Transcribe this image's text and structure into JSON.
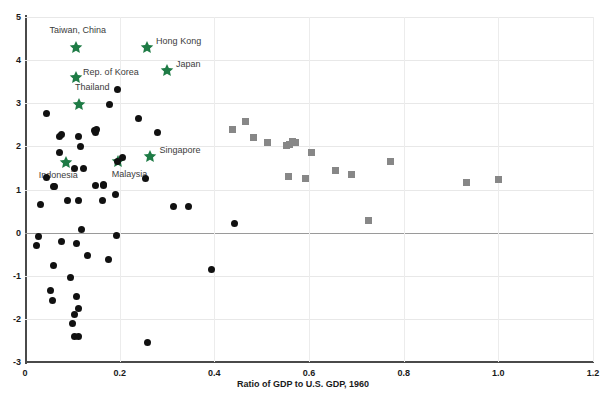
{
  "chart_data": {
    "type": "scatter",
    "title": "",
    "xlabel": "Ratio of GDP to U.S. GDP, 1960",
    "ylabel": "",
    "xlim": [
      0,
      1.2
    ],
    "ylim": [
      -3,
      5
    ],
    "xticks": [
      "0",
      "0.2",
      "0.4",
      "0.6",
      "0.8",
      "1.0",
      "1.2"
    ],
    "xtick_values": [
      0,
      0.2,
      0.4,
      0.6,
      0.8,
      1.0,
      1.2
    ],
    "yticks": [
      "5",
      "4",
      "3",
      "2",
      "1",
      "0",
      "-1",
      "-2",
      "-3"
    ],
    "ytick_values": [
      5,
      4,
      3,
      2,
      1,
      0,
      -1,
      -2,
      -3
    ],
    "grid": true,
    "zero_line": true,
    "legend_position": "none",
    "series": [
      {
        "name": "highlighted-economies",
        "marker": "star",
        "color": "#1e7b45",
        "points": [
          {
            "label": "Taiwan, China",
            "x": 0.108,
            "y": 4.3,
            "label_dx": -6,
            "label_dy": -16
          },
          {
            "label": "Hong Kong",
            "x": 0.258,
            "y": 4.3,
            "label_dx": 9,
            "label_dy": -5
          },
          {
            "label": "Japan",
            "x": 0.3,
            "y": 3.77,
            "label_dx": 9,
            "label_dy": -5
          },
          {
            "label": "Rep. of Korea",
            "x": 0.108,
            "y": 3.6,
            "label_dx": 7,
            "label_dy": -4
          },
          {
            "label": "Thailand",
            "x": 0.115,
            "y": 2.98,
            "label_dx": -9,
            "label_dy": -16
          },
          {
            "label": "Singapore",
            "x": 0.265,
            "y": 1.77,
            "label_dx": 9,
            "label_dy": -5
          },
          {
            "label": "Malaysia",
            "x": 0.196,
            "y": 1.66,
            "label_dx": -6,
            "label_dy": 14
          },
          {
            "label": "Indonesia",
            "x": 0.086,
            "y": 1.63,
            "label_dx": -27,
            "label_dy": 14
          }
        ]
      },
      {
        "name": "other-economies-dark",
        "marker": "circle",
        "color": "#111111",
        "points": [
          {
            "x": 0.046,
            "y": 2.76
          },
          {
            "x": 0.072,
            "y": 2.23
          },
          {
            "x": 0.078,
            "y": 2.27
          },
          {
            "x": 0.114,
            "y": 2.23
          },
          {
            "x": 0.146,
            "y": 2.36
          },
          {
            "x": 0.149,
            "y": 2.32
          },
          {
            "x": 0.152,
            "y": 2.4
          },
          {
            "x": 0.118,
            "y": 2.0
          },
          {
            "x": 0.196,
            "y": 3.33
          },
          {
            "x": 0.179,
            "y": 2.98
          },
          {
            "x": 0.24,
            "y": 2.64
          },
          {
            "x": 0.279,
            "y": 2.32
          },
          {
            "x": 0.072,
            "y": 1.86
          },
          {
            "x": 0.196,
            "y": 1.66
          },
          {
            "x": 0.205,
            "y": 1.75
          },
          {
            "x": 0.105,
            "y": 1.48
          },
          {
            "x": 0.123,
            "y": 1.48
          },
          {
            "x": 0.046,
            "y": 1.27
          },
          {
            "x": 0.061,
            "y": 1.06
          },
          {
            "x": 0.148,
            "y": 1.1
          },
          {
            "x": 0.254,
            "y": 1.25
          },
          {
            "x": 0.165,
            "y": 1.11
          },
          {
            "x": 0.192,
            "y": 0.89
          },
          {
            "x": 0.166,
            "y": 1.09
          },
          {
            "x": 0.032,
            "y": 0.65
          },
          {
            "x": 0.063,
            "y": 1.07
          },
          {
            "x": 0.09,
            "y": 0.74
          },
          {
            "x": 0.112,
            "y": 0.74
          },
          {
            "x": 0.163,
            "y": 0.74
          },
          {
            "x": 0.314,
            "y": 0.6
          },
          {
            "x": 0.346,
            "y": 0.6
          },
          {
            "x": 0.119,
            "y": 0.07
          },
          {
            "x": 0.028,
            "y": -0.1
          },
          {
            "x": 0.024,
            "y": -0.29
          },
          {
            "x": 0.194,
            "y": -0.06
          },
          {
            "x": 0.442,
            "y": 0.21
          },
          {
            "x": 0.077,
            "y": -0.21
          },
          {
            "x": 0.108,
            "y": -0.26
          },
          {
            "x": 0.133,
            "y": -0.53
          },
          {
            "x": 0.177,
            "y": -0.62
          },
          {
            "x": 0.06,
            "y": -0.77
          },
          {
            "x": 0.096,
            "y": -1.05
          },
          {
            "x": 0.395,
            "y": -0.86
          },
          {
            "x": 0.053,
            "y": -1.34
          },
          {
            "x": 0.059,
            "y": -1.58
          },
          {
            "x": 0.108,
            "y": -1.48
          },
          {
            "x": 0.112,
            "y": -1.76
          },
          {
            "x": 0.104,
            "y": -1.9
          },
          {
            "x": 0.1,
            "y": -2.11
          },
          {
            "x": 0.104,
            "y": -2.4
          },
          {
            "x": 0.114,
            "y": -2.42
          },
          {
            "x": 0.258,
            "y": -2.55
          }
        ]
      },
      {
        "name": "advanced-economies-gray",
        "marker": "square",
        "color": "#878787",
        "points": [
          {
            "x": 0.438,
            "y": 2.4
          },
          {
            "x": 0.466,
            "y": 2.58
          },
          {
            "x": 0.483,
            "y": 2.2
          },
          {
            "x": 0.512,
            "y": 2.09
          },
          {
            "x": 0.553,
            "y": 2.02
          },
          {
            "x": 0.558,
            "y": 2.04
          },
          {
            "x": 0.565,
            "y": 2.12
          },
          {
            "x": 0.572,
            "y": 2.1
          },
          {
            "x": 0.605,
            "y": 1.85
          },
          {
            "x": 0.655,
            "y": 1.45
          },
          {
            "x": 0.69,
            "y": 1.35
          },
          {
            "x": 0.556,
            "y": 1.31
          },
          {
            "x": 0.592,
            "y": 1.25
          },
          {
            "x": 0.772,
            "y": 1.65
          },
          {
            "x": 0.725,
            "y": 0.28
          },
          {
            "x": 0.932,
            "y": 1.17
          },
          {
            "x": 1.0,
            "y": 1.23
          }
        ]
      }
    ]
  }
}
